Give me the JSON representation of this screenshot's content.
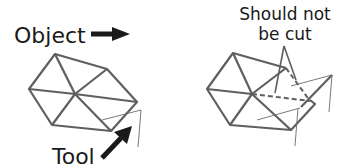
{
  "diagram": {
    "labels": {
      "object": "Object",
      "tool": "Tool",
      "should_not_line1": "Should not",
      "should_not_line2": "be cut"
    },
    "colors": {
      "mesh_edge": "#5f5f5f",
      "thin_line": "#6a6a6a",
      "arrow": "#1a1a1a",
      "text": "#1a1a1a",
      "background": "#ffffff"
    },
    "panels": [
      {
        "name": "before-cut",
        "description": "Hexagonal triangulated object with tool approaching lower-right corner"
      },
      {
        "name": "after-cut",
        "description": "Object with cut corner; dashed edges marked should not be cut"
      }
    ]
  }
}
